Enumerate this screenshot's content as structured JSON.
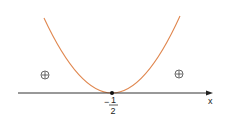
{
  "diagram": {
    "axis": {
      "label": "x",
      "color": "#333333"
    },
    "curve": {
      "type": "parabola",
      "color": "#e0874f",
      "vertex_x_label": "-1/2"
    },
    "vertex_label": {
      "sign": "−",
      "numerator": "1",
      "denominator": "2"
    },
    "regions": [
      {
        "position": "left",
        "sign": "⊕"
      },
      {
        "position": "right",
        "sign": "⊕"
      }
    ]
  }
}
